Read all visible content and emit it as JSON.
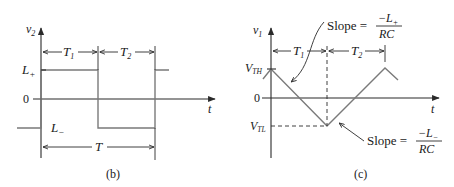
{
  "panel_b": {
    "caption": "(b)",
    "y_axis_label": "v",
    "y_axis_sub": "2",
    "x_axis_label": "t",
    "level_high": "L",
    "level_high_sub": "+",
    "level_zero": "0",
    "level_low": "L",
    "level_low_sub": "−",
    "interval_1": "T",
    "interval_1_sub": "1",
    "interval_2": "T",
    "interval_2_sub": "2",
    "period": "T"
  },
  "panel_c": {
    "caption": "(c)",
    "y_axis_label": "v",
    "y_axis_sub": "1",
    "x_axis_label": "t",
    "threshold_high": "V",
    "threshold_high_sub": "TH",
    "level_zero": "0",
    "threshold_low": "V",
    "threshold_low_sub": "TL",
    "interval_1": "T",
    "interval_1_sub": "1",
    "interval_2": "T",
    "interval_2_sub": "2",
    "slope_falling": {
      "prefix": "Slope =",
      "numerator": "−L",
      "numerator_sub": "+",
      "denominator": "RC"
    },
    "slope_rising": {
      "prefix": "Slope =",
      "numerator": "−L",
      "numerator_sub": "−",
      "denominator": "RC"
    }
  },
  "colors": {
    "waveform": "#7a7a7a",
    "axes": "#2a2a2a",
    "text": "#1a1a1a"
  }
}
